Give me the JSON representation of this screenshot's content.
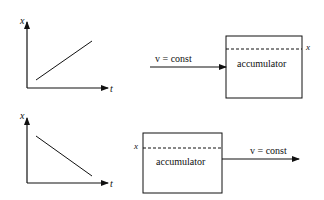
{
  "diagram": {
    "colors": {
      "stroke": "#111111",
      "background": "#ffffff"
    },
    "top_panel": {
      "graph": {
        "y_label": "x",
        "x_label": "t",
        "trend": "increasing"
      },
      "flow": {
        "arrow_label": "v = const",
        "direction": "into accumulator"
      },
      "box": {
        "label": "accumulator",
        "level_label": "x"
      }
    },
    "bottom_panel": {
      "graph": {
        "y_label": "x",
        "x_label": "t",
        "trend": "decreasing"
      },
      "flow": {
        "arrow_label": "v = const",
        "direction": "out of accumulator"
      },
      "box": {
        "label": "accumulator",
        "level_label": "x"
      }
    }
  }
}
